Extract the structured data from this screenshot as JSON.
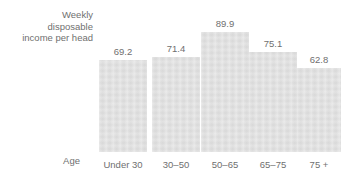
{
  "chart_data": {
    "type": "bar",
    "title": "",
    "subtitle": "",
    "xlabel": "Age",
    "ylabel": "Weekly\ndisposable\nincome per head",
    "categories": [
      "Under 30",
      "30–50",
      "50–65",
      "65–75",
      "75 +"
    ],
    "values": [
      69.2,
      71.4,
      89.9,
      75.1,
      62.8
    ],
    "value_labels": [
      "69.2",
      "71.4",
      "89.9",
      "75.1",
      "62.8"
    ],
    "ylim": [
      0,
      89.9
    ],
    "grid": false,
    "legend": null,
    "axis_lines": false,
    "bar_color": "#dedede",
    "text_color": "#6f6f6f",
    "background_color": "#ffffff"
  },
  "axes": {
    "y_caption": "Weekly\ndisposable\nincome per head",
    "x_caption": "Age"
  }
}
